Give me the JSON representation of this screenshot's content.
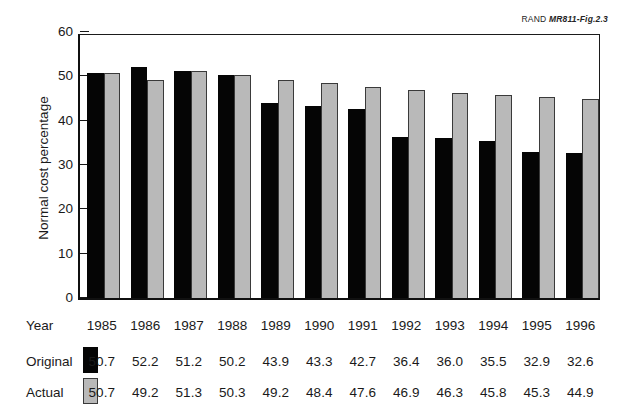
{
  "figure_label": {
    "organization": "RAND",
    "code": "MR811-Fig.2.3"
  },
  "table": {
    "row_labels": {
      "year": "Year",
      "original": "Original",
      "actual": "Actual"
    },
    "legend": {
      "original_swatch": "black-square-swatch",
      "actual_swatch": "gray-square-swatch"
    }
  },
  "chart_data": {
    "type": "bar",
    "title": "",
    "xlabel": "Year",
    "ylabel": "Normal cost percentage",
    "ylim": [
      0,
      60
    ],
    "yticks": [
      0,
      10,
      20,
      30,
      40,
      50,
      60
    ],
    "ytick_labels": [
      "0",
      "10",
      "20",
      "30",
      "40",
      "50",
      "60"
    ],
    "grid": false,
    "legend_position": "bottom-table",
    "categories": [
      "1985",
      "1986",
      "1987",
      "1988",
      "1989",
      "1990",
      "1991",
      "1992",
      "1993",
      "1994",
      "1995",
      "1996"
    ],
    "series": [
      {
        "name": "Original",
        "color": "#050505",
        "values": [
          50.7,
          52.2,
          51.2,
          50.2,
          43.9,
          43.3,
          42.7,
          36.4,
          36.0,
          35.5,
          32.9,
          32.6
        ]
      },
      {
        "name": "Actual",
        "color": "#b9b9b9",
        "values": [
          50.7,
          49.2,
          51.3,
          50.3,
          49.2,
          48.4,
          47.6,
          46.9,
          46.3,
          45.8,
          45.3,
          44.9
        ]
      }
    ]
  }
}
